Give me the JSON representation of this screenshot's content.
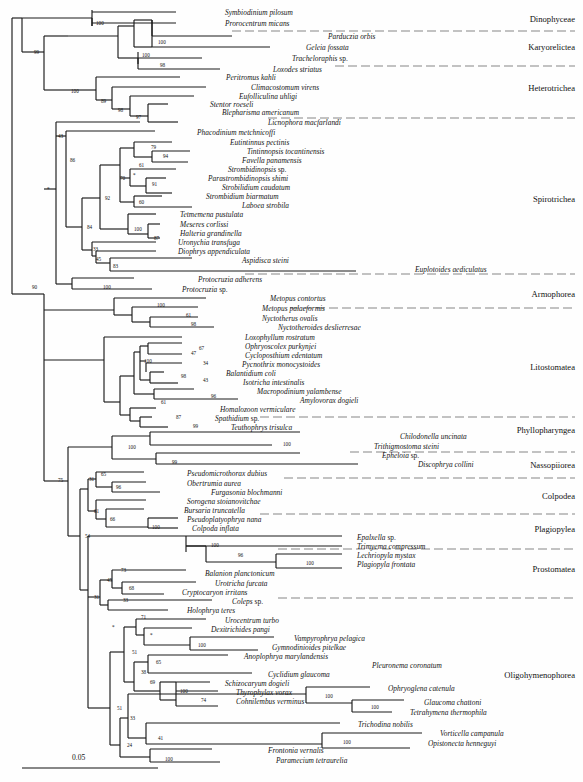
{
  "figure": {
    "type": "phylogenetic-tree",
    "scale_bar": {
      "label": "0.05",
      "x1": 22,
      "x2": 158,
      "y": 768
    }
  },
  "clade_labels": [
    {
      "name": "Dinophyceae",
      "label": "Dinophyceae",
      "y": 20
    },
    {
      "name": "Karyorelictea",
      "label": "Karyorelictea",
      "y": 48
    },
    {
      "name": "Heterotrichea",
      "label": "Heterotrichea",
      "y": 89
    },
    {
      "name": "Spirotrichea",
      "label": "Spirotrichea",
      "y": 200
    },
    {
      "name": "Armophorea",
      "label": "Armophorea",
      "y": 295
    },
    {
      "name": "Litostomatea",
      "label": "Litostomatea",
      "y": 368
    },
    {
      "name": "Phyllopharyngea",
      "label": "Phyllopharyngea",
      "y": 431
    },
    {
      "name": "Nassopiiorea",
      "label": "Nassopiiorea",
      "y": 466
    },
    {
      "name": "Colpodea",
      "label": "Colpodea",
      "y": 497
    },
    {
      "name": "Plagiopylea",
      "label": "Plagiopylea",
      "y": 530
    },
    {
      "name": "Prostomatea",
      "label": "Prostomatea",
      "y": 570
    },
    {
      "name": "Oligohymenophorea",
      "label": "Oligohymenophorea",
      "y": 676
    }
  ],
  "separators": [
    {
      "y": 31,
      "x1": 232,
      "x2": 575
    },
    {
      "y": 66,
      "x1": 335,
      "x2": 575
    },
    {
      "y": 118,
      "x1": 268,
      "x2": 575
    },
    {
      "y": 274,
      "x1": 245,
      "x2": 575
    },
    {
      "y": 308,
      "x1": 290,
      "x2": 575
    },
    {
      "y": 417,
      "x1": 260,
      "x2": 575
    },
    {
      "y": 452,
      "x1": 350,
      "x2": 575
    },
    {
      "y": 478,
      "x1": 284,
      "x2": 575
    },
    {
      "y": 514,
      "x1": 260,
      "x2": 575
    },
    {
      "y": 549,
      "x1": 278,
      "x2": 575
    },
    {
      "y": 598,
      "x1": 278,
      "x2": 575
    }
  ],
  "taxa": [
    {
      "name": "symbiodinium-pilosum",
      "label": "Symbiodinium pilosum",
      "x": 225,
      "y": 14
    },
    {
      "name": "prorocentrum-micans",
      "label": "Prorocentrum micans",
      "x": 225,
      "y": 25
    },
    {
      "name": "parduczia-orbis",
      "label": "Parduczia orbis",
      "x": 328,
      "y": 38
    },
    {
      "name": "geleia-fossata",
      "label": "Geleia fossata",
      "x": 306,
      "y": 49
    },
    {
      "name": "tracheloraphis-sp",
      "label": "Tracheloraphis ",
      "suffix": "sp.",
      "x": 292,
      "y": 60
    },
    {
      "name": "loxodes-striatus",
      "label": "Loxodes striatus",
      "x": 273,
      "y": 71
    },
    {
      "name": "peritromus-kahli",
      "label": "Peritromus kahli",
      "x": 226,
      "y": 79
    },
    {
      "name": "climacostomum-virens",
      "label": "Climacostomum virens",
      "x": 251,
      "y": 89
    },
    {
      "name": "eufolliculina-uhligi",
      "label": "Eufolliculina uhligi",
      "x": 239,
      "y": 98
    },
    {
      "name": "stentor-roeseli",
      "label": "Stentor roeseli",
      "x": 210,
      "y": 106
    },
    {
      "name": "blepharisma-americanum",
      "label": "Blepharisma americanum",
      "x": 222,
      "y": 114
    },
    {
      "name": "licnophora-macfarlandi",
      "label": "Licnophora macfarlandi",
      "x": 268,
      "y": 124
    },
    {
      "name": "phacodinium-metchnicoffi",
      "label": "Phacodinium metchnicoffi",
      "x": 197,
      "y": 134
    },
    {
      "name": "eutintinnus-pectinis",
      "label": "Eutintinnus pectinis",
      "x": 230,
      "y": 144
    },
    {
      "name": "tintinnopsis-tocantinensis",
      "label": "Tintinnopsis tocantinensis",
      "x": 247,
      "y": 153
    },
    {
      "name": "favella-panamensis",
      "label": "Favella panamensis",
      "x": 242,
      "y": 162
    },
    {
      "name": "strombidinopsis-sp",
      "label": "Strombidinopsis ",
      "suffix": "sp.",
      "x": 228,
      "y": 171
    },
    {
      "name": "parastrombidinopsis-shimi",
      "label": "Parastrombidinopsis shimi",
      "x": 208,
      "y": 180
    },
    {
      "name": "strobilidium-caudatum",
      "label": "Strobilidium caudatum",
      "x": 222,
      "y": 189
    },
    {
      "name": "strombidium-biarmatum",
      "label": "Strombidium biarmatum",
      "x": 206,
      "y": 198
    },
    {
      "name": "laboea-strobila",
      "label": "Laboea strobila",
      "x": 242,
      "y": 207
    },
    {
      "name": "tetmemena-pustulata",
      "label": "Tetmemena pustulata",
      "x": 180,
      "y": 216
    },
    {
      "name": "meseres-corlissi",
      "label": "Meseres corlissi",
      "x": 180,
      "y": 226
    },
    {
      "name": "halteria-grandinella",
      "label": "Halteria grandinella",
      "x": 180,
      "y": 235
    },
    {
      "name": "uronychia-transfuga",
      "label": "Uronychia transfuga",
      "x": 178,
      "y": 244
    },
    {
      "name": "diophrys-appendiculata",
      "label": "Diophrys appendiculata",
      "x": 178,
      "y": 253
    },
    {
      "name": "aspidisca-steini",
      "label": "Aspidisca steini",
      "x": 242,
      "y": 262
    },
    {
      "name": "euplotoides-aediculatus",
      "label": "Euplotoides aediculatus",
      "x": 415,
      "y": 271
    },
    {
      "name": "protocruzia-adherens",
      "label": "Protocruzia adherens",
      "x": 198,
      "y": 281
    },
    {
      "name": "protocruzia-sp",
      "label": "Protocruzia ",
      "suffix": "sp.",
      "x": 182,
      "y": 291
    },
    {
      "name": "metopus-contortus",
      "label": "Metopus contortus",
      "x": 270,
      "y": 300
    },
    {
      "name": "metopus-palaeformis",
      "label": "Metopus palaeformis",
      "x": 262,
      "y": 310
    },
    {
      "name": "nyctotherus-ovalis",
      "label": "Nyctotherus ovalis",
      "x": 262,
      "y": 320
    },
    {
      "name": "nyctotheroides-deslierresae",
      "label": "Nyctotheroides deslierresae",
      "x": 278,
      "y": 329
    },
    {
      "name": "loxophyllum-rostratum",
      "label": "Loxophyllum rostratum",
      "x": 245,
      "y": 339
    },
    {
      "name": "ophryoscolex-purkynjei",
      "label": "Ophryoscolex purkynjei",
      "x": 245,
      "y": 348
    },
    {
      "name": "cycloposthium-edentatum",
      "label": "Cycloposthium edentatum",
      "x": 245,
      "y": 357
    },
    {
      "name": "pycnothrix-monocystoides",
      "label": "Pycnothrix monocystoides",
      "x": 242,
      "y": 366
    },
    {
      "name": "balantidium-coli",
      "label": "Balantidium coli",
      "x": 226,
      "y": 375
    },
    {
      "name": "isotricha-intestinalis",
      "label": "Isotricha intestinalis",
      "x": 243,
      "y": 384
    },
    {
      "name": "macropodinium-yalambense",
      "label": "Macropodinium yalambense",
      "x": 257,
      "y": 393
    },
    {
      "name": "amylovorax-dogieli",
      "label": "Amylovorax dogieli",
      "x": 300,
      "y": 402
    },
    {
      "name": "homalozoon-vermiculare",
      "label": "Homalozoon vermiculare",
      "x": 220,
      "y": 411
    },
    {
      "name": "spathidium-sp",
      "label": "Spathidium ",
      "suffix": "sp.",
      "x": 215,
      "y": 420
    },
    {
      "name": "teuthophrys-trisulca",
      "label": "Teuthophrys trisulca",
      "x": 231,
      "y": 429
    },
    {
      "name": "chilodonella-uncinata",
      "label": "Chilodonella uncinata",
      "x": 400,
      "y": 438
    },
    {
      "name": "trithigmostoma-steini",
      "label": "Trithigmostoma steini",
      "x": 374,
      "y": 448
    },
    {
      "name": "epheloia-sp",
      "label": "Epheloia ",
      "suffix": "sp.",
      "x": 382,
      "y": 457
    },
    {
      "name": "discophrya-collini",
      "label": "Discophrya collini",
      "x": 418,
      "y": 466
    },
    {
      "name": "pseudomicrothorax-dubius",
      "label": "Pseudomicrothorax dubius",
      "x": 187,
      "y": 475
    },
    {
      "name": "obertrumia-aurea",
      "label": "Obertrumia aurea",
      "x": 187,
      "y": 485
    },
    {
      "name": "furgasonia-blochmanni",
      "label": "Furgasonia blochmanni",
      "x": 211,
      "y": 494
    },
    {
      "name": "sorogena-stoianovitchae",
      "label": "Sorogena stoianovitchae",
      "x": 187,
      "y": 503
    },
    {
      "name": "bursaria-truncatella",
      "label": "Bursaria truncatella",
      "x": 184,
      "y": 512
    },
    {
      "name": "pseudoplatyophrya-nana",
      "label": "Pseudoplatyophrya nana",
      "x": 187,
      "y": 521
    },
    {
      "name": "colpoda-inflata",
      "label": "Colpoda inflata",
      "x": 192,
      "y": 530
    },
    {
      "name": "epalxella-sp",
      "label": "Epalxella ",
      "suffix": "sp.",
      "x": 357,
      "y": 539
    },
    {
      "name": "trimyema-compressum",
      "label": "Trimyema compressum",
      "x": 357,
      "y": 548
    },
    {
      "name": "lechriopyla-mystax",
      "label": "Lechriopyla mystax",
      "x": 357,
      "y": 557
    },
    {
      "name": "plagiopyla-frontata",
      "label": "Plagiopyla frontata",
      "x": 357,
      "y": 566
    },
    {
      "name": "balanion-planctonicum",
      "label": "Balanion planctonicum",
      "x": 205,
      "y": 575
    },
    {
      "name": "urotricha-furcata",
      "label": "Urotricha furcata",
      "x": 215,
      "y": 585
    },
    {
      "name": "cryptocaryon-irritans",
      "label": "Cryptocaryon irritans",
      "x": 182,
      "y": 594
    },
    {
      "name": "coleps-sp",
      "label": "Coleps ",
      "suffix": "sp.",
      "x": 232,
      "y": 603
    },
    {
      "name": "holophrya-teres",
      "label": "Holophrya teres",
      "x": 187,
      "y": 612
    },
    {
      "name": "urocentrum-turbo",
      "label": "Urocentrum turbo",
      "x": 225,
      "y": 622
    },
    {
      "name": "dexitrichides-pangi",
      "label": "Dexitrichides pangi",
      "x": 211,
      "y": 631
    },
    {
      "name": "vampyrophrya-pelagica",
      "label": "Vampyrophrya pelagica",
      "x": 294,
      "y": 640
    },
    {
      "name": "gymnodinioides-pitelkae",
      "label": "Gymnodinioides pitelkae",
      "x": 272,
      "y": 649
    },
    {
      "name": "anoplophrya-marylandensis",
      "label": "Anoplophrya marylandensis",
      "x": 244,
      "y": 658
    },
    {
      "name": "pleuronema-coronatum",
      "label": "Pleuronema coronatum",
      "x": 372,
      "y": 667
    },
    {
      "name": "cyclidium-glaucoma",
      "label": "Cyclidium glaucoma",
      "x": 268,
      "y": 676
    },
    {
      "name": "schizocaryum-dogieli",
      "label": "Schizocaryum dogieli",
      "x": 225,
      "y": 685
    },
    {
      "name": "thyrophylax-vorax",
      "label": "Thyrophylax vorax",
      "x": 236,
      "y": 694
    },
    {
      "name": "cohnilembus-verminus",
      "label": "Cohnilembus verminus",
      "x": 236,
      "y": 703
    },
    {
      "name": "ophryoglena-catenula",
      "label": "Ophryoglena catenula",
      "x": 388,
      "y": 690
    },
    {
      "name": "glaucoma-chattoni",
      "label": "Glaucoma chattoni",
      "x": 424,
      "y": 704
    },
    {
      "name": "tetrahymena-thermophila",
      "label": "Tetrahymena thermophila",
      "x": 410,
      "y": 714
    },
    {
      "name": "trichodina-nobilis",
      "label": "Trichodina nobilis",
      "x": 358,
      "y": 726
    },
    {
      "name": "vorticella-campanula",
      "label": "Vorticella campanula",
      "x": 440,
      "y": 735
    },
    {
      "name": "opistonecta-henneguyi",
      "label": "Opistonecta henneguyi",
      "x": 428,
      "y": 745
    },
    {
      "name": "frontonia-vernalis",
      "label": "Frontonia vernalis",
      "x": 268,
      "y": 752
    },
    {
      "name": "paramecium-tetraurelia",
      "label": "Paramecium tetraurelia",
      "x": 276,
      "y": 762
    }
  ],
  "bootstrap_values": [
    {
      "value": "100",
      "x": 96,
      "y": 23
    },
    {
      "value": "100",
      "x": 142,
      "y": 55
    },
    {
      "value": "100",
      "x": 158,
      "y": 42
    },
    {
      "value": "98",
      "x": 160,
      "y": 65
    },
    {
      "value": "99",
      "x": 34,
      "y": 52
    },
    {
      "value": "100",
      "x": 71,
      "y": 91
    },
    {
      "value": "89",
      "x": 101,
      "y": 101
    },
    {
      "value": "98",
      "x": 118,
      "y": 110
    },
    {
      "value": "97",
      "x": 136,
      "y": 117
    },
    {
      "value": "43",
      "x": 58,
      "y": 136
    },
    {
      "value": "86",
      "x": 70,
      "y": 160
    },
    {
      "value": "79",
      "x": 151,
      "y": 147
    },
    {
      "value": "94",
      "x": 163,
      "y": 156
    },
    {
      "value": "61",
      "x": 139,
      "y": 165
    },
    {
      "value": "*",
      "x": 133,
      "y": 175
    },
    {
      "value": "91",
      "x": 152,
      "y": 184
    },
    {
      "value": "70",
      "x": 120,
      "y": 178
    },
    {
      "value": "60",
      "x": 139,
      "y": 202
    },
    {
      "value": "92",
      "x": 105,
      "y": 198
    },
    {
      "value": "100",
      "x": 134,
      "y": 229
    },
    {
      "value": "87",
      "x": 154,
      "y": 238
    },
    {
      "value": "84",
      "x": 87,
      "y": 227
    },
    {
      "value": "33",
      "x": 93,
      "y": 249
    },
    {
      "value": "45",
      "x": 96,
      "y": 259
    },
    {
      "value": "83",
      "x": 113,
      "y": 266
    },
    {
      "value": "*",
      "x": 47,
      "y": 189
    },
    {
      "value": "100",
      "x": 103,
      "y": 287
    },
    {
      "value": "90",
      "x": 32,
      "y": 287
    },
    {
      "value": "100",
      "x": 157,
      "y": 305
    },
    {
      "value": "61",
      "x": 186,
      "y": 315
    },
    {
      "value": "98",
      "x": 191,
      "y": 324
    },
    {
      "value": "100",
      "x": 144,
      "y": 361
    },
    {
      "value": "47",
      "x": 191,
      "y": 353
    },
    {
      "value": "67",
      "x": 199,
      "y": 348
    },
    {
      "value": "34",
      "x": 203,
      "y": 363
    },
    {
      "value": "43",
      "x": 203,
      "y": 380
    },
    {
      "value": "98",
      "x": 181,
      "y": 376
    },
    {
      "value": "96",
      "x": 211,
      "y": 396
    },
    {
      "value": "61",
      "x": 161,
      "y": 402
    },
    {
      "value": "87",
      "x": 176,
      "y": 417
    },
    {
      "value": "99",
      "x": 193,
      "y": 426
    },
    {
      "value": "100",
      "x": 283,
      "y": 444
    },
    {
      "value": "100",
      "x": 128,
      "y": 447
    },
    {
      "value": "99",
      "x": 172,
      "y": 462
    },
    {
      "value": "75",
      "x": 58,
      "y": 480
    },
    {
      "value": "31",
      "x": 89,
      "y": 479
    },
    {
      "value": "65",
      "x": 101,
      "y": 474
    },
    {
      "value": "96",
      "x": 116,
      "y": 487
    },
    {
      "value": "61",
      "x": 94,
      "y": 511
    },
    {
      "value": "66",
      "x": 110,
      "y": 519
    },
    {
      "value": "100",
      "x": 152,
      "y": 527
    },
    {
      "value": "54",
      "x": 85,
      "y": 536
    },
    {
      "value": "100",
      "x": 211,
      "y": 545
    },
    {
      "value": "96",
      "x": 238,
      "y": 555
    },
    {
      "value": "100",
      "x": 306,
      "y": 563
    },
    {
      "value": "73",
      "x": 121,
      "y": 570
    },
    {
      "value": "45",
      "x": 107,
      "y": 580
    },
    {
      "value": "68",
      "x": 129,
      "y": 588
    },
    {
      "value": "33",
      "x": 123,
      "y": 600
    },
    {
      "value": "31",
      "x": 94,
      "y": 597
    },
    {
      "value": "71",
      "x": 141,
      "y": 617
    },
    {
      "value": "*",
      "x": 150,
      "y": 635
    },
    {
      "value": "100",
      "x": 198,
      "y": 645
    },
    {
      "value": "51",
      "x": 132,
      "y": 652
    },
    {
      "value": "65",
      "x": 156,
      "y": 662
    },
    {
      "value": "38",
      "x": 141,
      "y": 672
    },
    {
      "value": "69",
      "x": 150,
      "y": 682
    },
    {
      "value": "100",
      "x": 180,
      "y": 691
    },
    {
      "value": "74",
      "x": 201,
      "y": 700
    },
    {
      "value": "*",
      "x": 112,
      "y": 627
    },
    {
      "value": "51",
      "x": 117,
      "y": 708
    },
    {
      "value": "100",
      "x": 325,
      "y": 696
    },
    {
      "value": "100",
      "x": 371,
      "y": 707
    },
    {
      "value": "33",
      "x": 130,
      "y": 718
    },
    {
      "value": "41",
      "x": 158,
      "y": 738
    },
    {
      "value": "100",
      "x": 343,
      "y": 742
    },
    {
      "value": "24",
      "x": 127,
      "y": 745
    },
    {
      "value": "100",
      "x": 165,
      "y": 759
    }
  ],
  "tree_edges": {
    "description": "Rectangular cladogram branch segments drawn as SVG paths"
  }
}
